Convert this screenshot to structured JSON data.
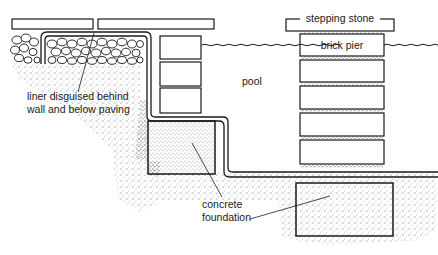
{
  "diagram": {
    "labels": {
      "stepping_stone": "stepping stone",
      "brick_pier": "brick pier",
      "pool": "pool",
      "liner_line1": "liner disguised behind",
      "liner_line2": "wall and below paving",
      "concrete_line1": "concrete",
      "concrete_line2": "foundation"
    },
    "components": [
      {
        "id": "paving-slabs",
        "name": "Paving slabs"
      },
      {
        "id": "rubble-fill",
        "name": "Rubble / stone fill"
      },
      {
        "id": "pool-liner",
        "name": "Pool liner"
      },
      {
        "id": "retaining-wall",
        "name": "Brick retaining wall (3 courses)"
      },
      {
        "id": "wall-foundation",
        "name": "Concrete foundation under wall"
      },
      {
        "id": "stepping-stone",
        "name": "Stepping stone"
      },
      {
        "id": "brick-pier",
        "name": "Brick pier (5 courses)"
      },
      {
        "id": "pier-foundation",
        "name": "Concrete foundation under pier"
      },
      {
        "id": "water-surface",
        "name": "Water surface"
      },
      {
        "id": "soil",
        "name": "Surrounding soil"
      }
    ],
    "colors": {
      "ink": "#1a1a1a",
      "paper": "#ffffff",
      "stipple": "#555555"
    }
  }
}
